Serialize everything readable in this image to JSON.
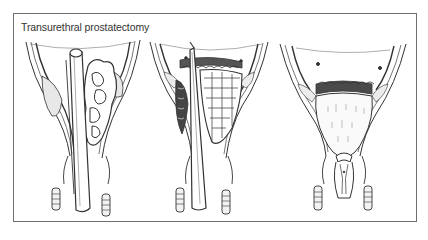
{
  "figure": {
    "title": "Transurethral prostatectomy",
    "border_color": "#6f6f6f",
    "line_color": "#333333",
    "panels": [
      {
        "id": "panel-1",
        "description": "Resectoscope inserted through urethra alongside enlarged prostate adenoma"
      },
      {
        "id": "panel-2",
        "description": "Resectoscope resecting adenoma tissue chips at bladder neck"
      },
      {
        "id": "panel-3",
        "description": "Resected prostatic fossa after completed transurethral resection"
      }
    ]
  }
}
